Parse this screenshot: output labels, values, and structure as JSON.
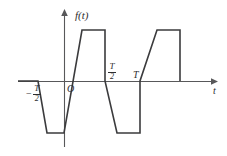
{
  "figure": {
    "kind": "piecewise-periodic-waveform-plot",
    "background_color": "#ffffff",
    "axis_color": "#58585a",
    "curve_color": "#3b3b3d",
    "labels": {
      "y_axis": "f(t)",
      "x_axis": "t",
      "origin": "O",
      "tick_neg_half_period_minus": "−",
      "tick_neg_half_period_num": "T",
      "tick_neg_half_period_den": "2",
      "tick_half_period_num": "T",
      "tick_half_period_den": "2",
      "tick_period": "T"
    }
  },
  "chart_data": {
    "type": "line",
    "title": "",
    "xlabel": "t",
    "ylabel": "f(t)",
    "xlim": [
      -0.95,
      1.55
    ],
    "ylim": [
      -1.25,
      1.25
    ],
    "grid": false,
    "legend": null,
    "annotations": [
      {
        "text": "f(t)",
        "role": "y-axis-label"
      },
      {
        "text": "t",
        "role": "x-axis-label"
      },
      {
        "text": "O",
        "role": "origin-label"
      },
      {
        "text": "-T/2",
        "role": "x-tick-label",
        "x": -0.5
      },
      {
        "text": "T/2",
        "role": "x-tick-label",
        "x": 0.5
      },
      {
        "text": "T",
        "role": "x-tick-label",
        "x": 1.0
      }
    ],
    "xticks": [
      -0.5,
      0,
      0.5,
      1.0
    ],
    "xticklabels": [
      "-T/2",
      "O",
      "T/2",
      "T"
    ],
    "series": [
      {
        "name": "f(t)",
        "x": [
          -0.95,
          -0.78,
          -0.6,
          -0.28,
          -0.28,
          0.0,
          0.22,
          0.72,
          0.72,
          1.0,
          1.22,
          1.55,
          1.55
        ],
        "y": [
          0.0,
          0.0,
          -1.0,
          -1.0,
          -1.0,
          0.0,
          1.0,
          1.0,
          -1.0,
          -1.0,
          0.0,
          1.0,
          0.0
        ],
        "vertices_px": [
          [
            18,
            81
          ],
          [
            38,
            81
          ],
          [
            47,
            133
          ],
          [
            64,
            133
          ],
          [
            82,
            30
          ],
          [
            105,
            30
          ],
          [
            105,
            81
          ],
          [
            117,
            133
          ],
          [
            140,
            133
          ],
          [
            140,
            81
          ],
          [
            157,
            30
          ],
          [
            180,
            30
          ],
          [
            180,
            81
          ]
        ]
      }
    ]
  }
}
